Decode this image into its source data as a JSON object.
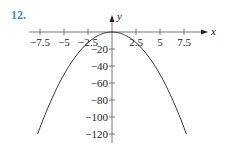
{
  "problem": {
    "number": "12."
  },
  "chart_data": {
    "type": "line",
    "title": "",
    "xlabel": "x",
    "ylabel": "y",
    "function": "y = -2x^2",
    "x_ticks": [
      -7.5,
      -5,
      -2.5,
      2.5,
      5,
      7.5
    ],
    "x_tick_labels": [
      "−7.5",
      "−5",
      "−2.5",
      "2.5",
      "5",
      "7.5"
    ],
    "y_ticks": [
      -20,
      -40,
      -60,
      -80,
      -100,
      -120
    ],
    "y_tick_labels": [
      "−20",
      "−40",
      "−60",
      "−80",
      "−100",
      "−120"
    ],
    "xlim": [
      -9.5,
      10
    ],
    "ylim": [
      -130,
      15
    ],
    "grid": false,
    "series": [
      {
        "name": "parabola",
        "x": [
          -7.75,
          -7.5,
          -6,
          -5,
          -4,
          -2.5,
          -2,
          -1,
          0,
          1,
          2,
          2.5,
          4,
          5,
          6,
          7.5,
          7.75
        ],
        "y": [
          -120.1,
          -112.5,
          -72,
          -50,
          -32,
          -12.5,
          -8,
          -2,
          0,
          -2,
          -8,
          -12.5,
          -32,
          -50,
          -72,
          -112.5,
          -120.1
        ]
      }
    ],
    "colors": {
      "curve": "#333333",
      "axes": "#555555",
      "problem_number": "#3a8fc8"
    }
  }
}
